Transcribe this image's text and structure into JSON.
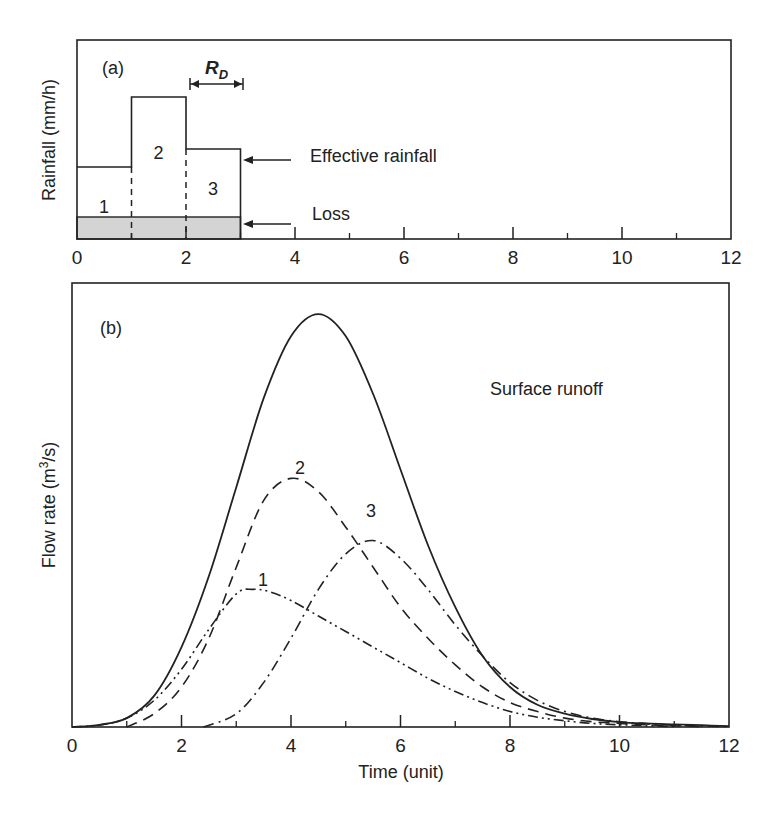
{
  "chart_data": [
    {
      "panel": "(a)",
      "type": "bar",
      "title": "",
      "xlabel": "",
      "ylabel": "Rainfall (mm/h)",
      "xlim": [
        0,
        12
      ],
      "ylim": [
        0,
        100
      ],
      "x_ticks": [
        0,
        2,
        4,
        6,
        8,
        10,
        12
      ],
      "x_minor_ticks": [
        1,
        3,
        5,
        7,
        9,
        11
      ],
      "grid": false,
      "blocks": [
        {
          "label": "1",
          "x0": 0,
          "x1": 1,
          "effective_top": 36,
          "loss_top": 11
        },
        {
          "label": "2",
          "x0": 1,
          "x1": 2,
          "effective_top": 71,
          "loss_top": 11
        },
        {
          "label": "3",
          "x0": 2,
          "x1": 3,
          "effective_top": 45,
          "loss_top": 11
        }
      ],
      "annotations": {
        "panel_label": "(a)",
        "duration_label": "R",
        "duration_subscript": "D",
        "duration_span": [
          2,
          3
        ],
        "effective_rainfall": "Effective rainfall",
        "loss": "Loss"
      }
    },
    {
      "panel": "(b)",
      "type": "line",
      "title": "",
      "xlabel": "Time (unit)",
      "ylabel": "Flow rate (m³/s)",
      "ylabel_parts": {
        "pre": "Flow rate (m",
        "sup": "3",
        "post": "/s)"
      },
      "xlim": [
        0,
        12
      ],
      "ylim": [
        0,
        100
      ],
      "x_ticks": [
        0,
        2,
        4,
        6,
        8,
        10,
        12
      ],
      "x_minor_ticks": [
        1,
        3,
        5,
        7,
        9,
        11
      ],
      "grid": false,
      "legend": "none (curves labelled inline)",
      "annotations": {
        "panel_label": "(b)",
        "surface_runoff": "Surface runoff",
        "curve_labels": [
          {
            "text": "1",
            "x": 3.4,
            "y": 35
          },
          {
            "text": "2",
            "x": 4.0,
            "y": 61
          },
          {
            "text": "3",
            "x": 5.5,
            "y": 49
          }
        ]
      },
      "series": [
        {
          "name": "Surface runoff (total)",
          "style": "solid",
          "x": [
            0,
            0.5,
            1,
            1.5,
            2,
            2.5,
            3,
            3.5,
            4,
            4.5,
            5,
            5.5,
            6,
            6.5,
            7,
            7.5,
            8,
            8.5,
            9,
            9.5,
            10,
            10.5,
            11,
            11.5,
            12
          ],
          "y": [
            0,
            0.5,
            2,
            7,
            18,
            34,
            54,
            74,
            88,
            93,
            88,
            75,
            58,
            41,
            27,
            16,
            9,
            5,
            3,
            1.8,
            1.1,
            0.8,
            0.6,
            0.4,
            0.2
          ]
        },
        {
          "name": "1",
          "style": "dash-dot-dot",
          "x": [
            0,
            0.5,
            1,
            1.5,
            2,
            2.5,
            3,
            3.3,
            3.6,
            4,
            4.5,
            5,
            5.5,
            6,
            6.5,
            7,
            7.5,
            8,
            8.5,
            9,
            9.5,
            10,
            10.5,
            11
          ],
          "y": [
            0,
            0.4,
            2,
            6,
            13,
            22,
            30,
            31,
            30.5,
            28.5,
            25,
            21.5,
            18,
            14.5,
            11,
            8,
            5.5,
            3.5,
            2.2,
            1.4,
            0.8,
            0.5,
            0.3,
            0.1
          ]
        },
        {
          "name": "2",
          "style": "dashed",
          "x": [
            1,
            1.5,
            2,
            2.5,
            3,
            3.5,
            4,
            4.5,
            5,
            5.5,
            6,
            6.5,
            7,
            7.5,
            8,
            8.5,
            9,
            9.5,
            10,
            10.5,
            11,
            11.5
          ],
          "y": [
            0,
            3,
            9,
            20,
            36,
            51,
            56,
            53,
            45,
            36,
            27,
            20,
            14,
            9,
            5.5,
            3.5,
            2,
            1.2,
            0.8,
            0.5,
            0.3,
            0.1
          ]
        },
        {
          "name": "3",
          "style": "dash-dot",
          "x": [
            2.4,
            3,
            3.5,
            4,
            4.5,
            5,
            5.5,
            6,
            6.5,
            7,
            7.5,
            8,
            8.5,
            9,
            9.5,
            10,
            10.5,
            11,
            11.5,
            12
          ],
          "y": [
            0,
            3,
            10,
            20,
            31,
            39,
            42,
            38,
            31,
            23,
            16,
            10,
            6,
            3.5,
            2,
            1.2,
            0.7,
            0.4,
            0.2,
            0.1
          ]
        }
      ]
    }
  ],
  "panel_a": {
    "label": "(a)",
    "ylabel": "Rainfall (mm/h)",
    "block_labels": [
      "1",
      "2",
      "3"
    ],
    "rd_main": "R",
    "rd_sub": "D",
    "effective_rainfall": "Effective rainfall",
    "loss": "Loss",
    "x_tick_labels": [
      "0",
      "2",
      "4",
      "6",
      "8",
      "10",
      "12"
    ]
  },
  "panel_b": {
    "label": "(b)",
    "ylabel_pre": "Flow rate (m",
    "ylabel_sup": "3",
    "ylabel_post": "/s)",
    "xlabel": "Time (unit)",
    "surface_runoff": "Surface runoff",
    "curve_labels": [
      "1",
      "2",
      "3"
    ],
    "x_tick_labels": [
      "0",
      "2",
      "4",
      "6",
      "8",
      "10",
      "12"
    ]
  },
  "colors": {
    "ink": "#222222",
    "loss_fill": "#d4d4d4",
    "background": "#ffffff"
  }
}
